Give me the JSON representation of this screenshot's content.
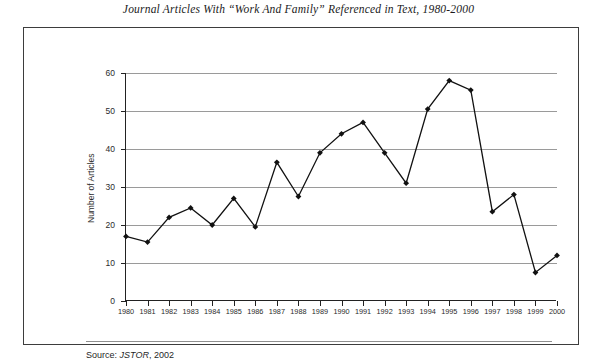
{
  "figure": {
    "title": "Journal Articles With “Work And Family” Referenced in Text, 1980-2000",
    "source_label": "Source:",
    "source_db": "JSTOR",
    "source_year": ", 2002"
  },
  "chart_data": {
    "type": "line",
    "title": "Journal Articles With “Work And Family” Referenced in Text, 1980-2000",
    "xlabel": "",
    "ylabel": "Number of Articles",
    "categories": [
      "1980",
      "1981",
      "1982",
      "1983",
      "1984",
      "1985",
      "1986",
      "1987",
      "1988",
      "1989",
      "1990",
      "1991",
      "1992",
      "1993",
      "1994",
      "1995",
      "1996",
      "1997",
      "1998",
      "1999",
      "2000"
    ],
    "values": [
      17,
      15.5,
      22,
      24.5,
      20,
      27,
      19.5,
      36.5,
      27.5,
      39,
      44,
      47,
      39,
      31,
      50.5,
      58,
      55.5,
      23.5,
      28,
      7.5,
      12
    ],
    "series": [
      {
        "name": "Number of Articles",
        "values": [
          17,
          15.5,
          22,
          24.5,
          20,
          27,
          19.5,
          36.5,
          27.5,
          39,
          44,
          47,
          39,
          31,
          50.5,
          58,
          55.5,
          23.5,
          28,
          7.5,
          12
        ]
      }
    ],
    "ylim": [
      0,
      60
    ],
    "yticks": [
      0,
      10,
      20,
      30,
      40,
      50,
      60
    ],
    "ytick_labels": [
      "0",
      "10",
      "20",
      "30",
      "40",
      "50",
      "60"
    ],
    "grid": true,
    "grid_axis": "y",
    "legend": false,
    "marker": "diamond",
    "line_color": "#111111",
    "marker_color": "#111111",
    "grid_color": "#9a9a9a",
    "axis_color": "#222222",
    "background_color": "#ffffff"
  }
}
